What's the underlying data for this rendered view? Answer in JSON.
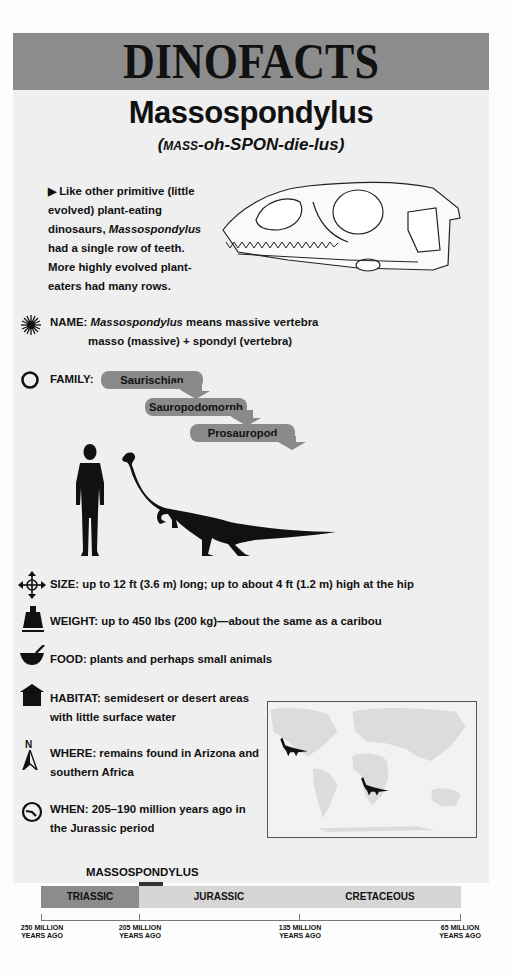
{
  "header": {
    "title": "DINOFACTS"
  },
  "dinosaur": {
    "name": "Massospondylus",
    "pronunciation_caps": "MASS",
    "pronunciation_rest": "-oh-SPON-die-lus",
    "pronunciation_open": "(",
    "pronunciation_close": ")"
  },
  "intro": {
    "bullet": "▶",
    "text_before": " Like other primitive (little evolved) plant-eating dinosaurs, ",
    "text_italic": "Massospondylus",
    "text_after": " had a single row of teeth. More highly evolved plant-eaters had many rows."
  },
  "facts": {
    "name": {
      "label": "NAME:",
      "italic": "Massospondylus",
      "line1_rest": " means massive vertebra",
      "line2": "masso (massive) + spondyl (vertebra)",
      "icon": "starburst-icon"
    },
    "family": {
      "label": "FAMILY:",
      "levels": [
        "Saurischian",
        "Sauropodomorph",
        "Prosauropod"
      ],
      "icon": "circle-icon"
    },
    "size": {
      "label": "SIZE:",
      "text": " up to 12 ft (3.6 m) long; up to about 4 ft (1.2 m) high at the hip",
      "icon": "four-way-arrow-icon"
    },
    "weight": {
      "label": "WEIGHT:",
      "text": " up to 450 lbs (200 kg)—about the same as a caribou",
      "icon": "weight-icon"
    },
    "food": {
      "label": "FOOD:",
      "text": " plants and perhaps small animals",
      "icon": "mortar-pestle-icon"
    },
    "habitat": {
      "label": "HABITAT:",
      "line1": " semidesert or desert areas",
      "line2": "with little surface water",
      "icon": "house-icon"
    },
    "where": {
      "label": "WHERE:",
      "line1": " remains found in Arizona and",
      "line2": "southern Africa",
      "icon": "north-arrow-icon",
      "north": "N"
    },
    "when": {
      "label": "WHEN:",
      "line1": " 205–190 million years ago in",
      "line2": "the Jurassic period",
      "icon": "clock-icon"
    }
  },
  "timeline": {
    "marker_label": "MASSOSPONDYLUS",
    "periods": [
      {
        "name": "TRIASSIC",
        "color": "#8c8c8c"
      },
      {
        "name": "JURASSIC",
        "color": "#d6d6d6"
      },
      {
        "name": "CRETACEOUS",
        "color": "#d6d6d6"
      }
    ],
    "ticks": [
      {
        "line1": "250 MILLION",
        "line2": "YEARS AGO"
      },
      {
        "line1": "205 MILLION",
        "line2": "YEARS AGO"
      },
      {
        "line1": "135 MILLION",
        "line2": "YEARS AGO"
      },
      {
        "line1": "65 MILLION",
        "line2": "YEARS AGO"
      }
    ]
  },
  "colors": {
    "banner": "#8c8c8c",
    "pill": "#8a8a8a",
    "page": "#efefef",
    "text": "#111111"
  }
}
